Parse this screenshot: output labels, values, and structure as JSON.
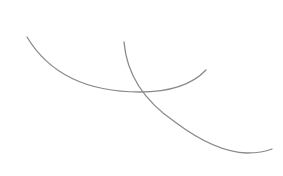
{
  "diagram": {
    "background": "#ffffff",
    "stroke_color": "#8a8a8a",
    "stroke_width": 1.3,
    "curves": [
      {
        "id": "arc-1",
        "d": "M 27 37 Q 60 92 140 92 Q 185 92 206 70"
      },
      {
        "id": "arc-2",
        "d": "M 124 42 Q 128 90 175 122 Q 215 152 247 153 Q 262 153 272 149"
      }
    ]
  }
}
